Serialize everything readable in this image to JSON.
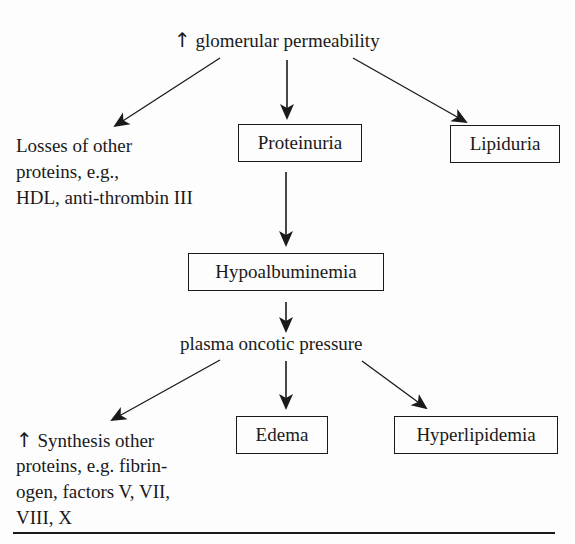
{
  "diagram": {
    "top": {
      "arrow_symbol": "↑",
      "label": "glomerular permeability"
    },
    "left_branch": {
      "lines": [
        "Losses of other",
        "proteins, e.g.,",
        "HDL, anti-thrombin III"
      ]
    },
    "proteinuria": "Proteinuria",
    "lipiduria": "Lipiduria",
    "hypoalbuminemia": "Hypoalbuminemia",
    "oncotic": {
      "label": "plasma oncotic pressure"
    },
    "synthesis": {
      "arrow_symbol": "↑",
      "lines": [
        "Synthesis other",
        "proteins, e.g. fibrin-",
        "ogen, factors V, VII,",
        "VIII, X"
      ]
    },
    "edema": "Edema",
    "hyperlipidemia": "Hyperlipidemia"
  }
}
